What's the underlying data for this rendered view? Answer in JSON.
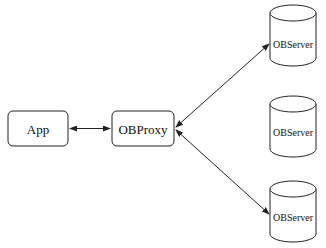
{
  "diagram": {
    "nodes": {
      "app": {
        "label": "App",
        "shape": "rounded-rect"
      },
      "proxy": {
        "label": "OBProxy",
        "shape": "rounded-rect"
      },
      "server1": {
        "label": "OBServer",
        "shape": "cylinder"
      },
      "server2": {
        "label": "OBServer",
        "shape": "cylinder"
      },
      "server3": {
        "label": "OBServer",
        "shape": "cylinder"
      }
    },
    "edges": [
      {
        "from": "app",
        "to": "proxy",
        "direction": "bidirectional"
      },
      {
        "from": "proxy",
        "to": "server1",
        "direction": "bidirectional"
      },
      {
        "from": "proxy",
        "to": "server3",
        "direction": "bidirectional"
      }
    ],
    "colors": {
      "stroke": "#222222",
      "background": "#ffffff"
    }
  }
}
